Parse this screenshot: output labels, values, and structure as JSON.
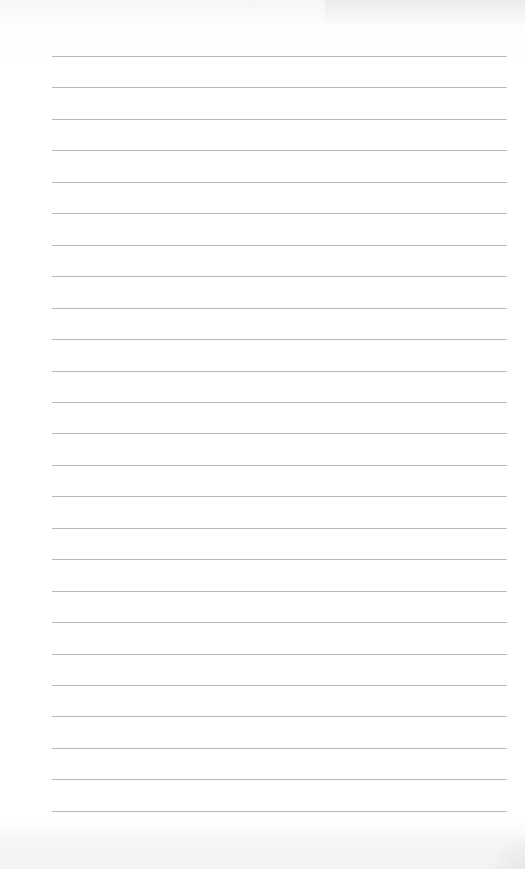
{
  "document": {
    "type": "lined-paper",
    "line_count": 25,
    "line_color": "#b9b9b9",
    "background_color": "#ffffff",
    "first_line_y": 56,
    "line_spacing": 31.45,
    "line_left": 52,
    "line_width": 455
  }
}
